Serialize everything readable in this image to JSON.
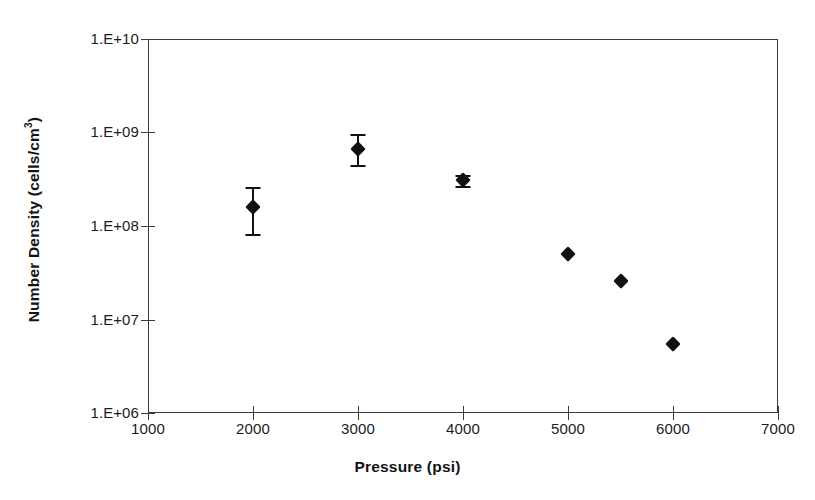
{
  "chart_data": {
    "type": "scatter",
    "title": "",
    "xlabel": "Pressure (psi)",
    "ylabel": "Number Density (cells/cm3)",
    "ylabel_base": "Number Density (cells/cm",
    "ylabel_sup": "3",
    "ylabel_tail": ")",
    "xlim": [
      1000,
      7000
    ],
    "ylim": [
      1000000,
      10000000000
    ],
    "yscale": "log",
    "xscale": "linear",
    "grid": false,
    "legend": null,
    "xticks": [
      1000,
      2000,
      3000,
      4000,
      5000,
      6000,
      7000
    ],
    "xticklabels": [
      "1000",
      "2000",
      "3000",
      "4000",
      "5000",
      "6000",
      "7000"
    ],
    "yticks": [
      1000000,
      10000000,
      100000000,
      1000000000,
      10000000000
    ],
    "yticklabels": [
      "1.E+06",
      "1.E+07",
      "1.E+08",
      "1.E+09",
      "1.E+10"
    ],
    "marker": "filled-diamond",
    "marker_color": "#111111",
    "series": [
      {
        "name": "Number Density",
        "x": [
          2000,
          3000,
          4000,
          5000,
          5500,
          6000
        ],
        "y": [
          160000000.0,
          660000000.0,
          310000000.0,
          50000000.0,
          26000000.0,
          5500000.0
        ],
        "yerr_low": [
          83000000.0,
          450000000.0,
          270000000.0,
          null,
          null,
          null
        ],
        "yerr_high": [
          260000000.0,
          960000000.0,
          350000000.0,
          null,
          null,
          null
        ]
      }
    ],
    "points": [
      {
        "label": "p-2000",
        "x": 2000,
        "y": 160000000.0,
        "err_low": 83000000.0,
        "err_high": 260000000.0,
        "has_errorbar": true
      },
      {
        "label": "p-3000",
        "x": 3000,
        "y": 660000000.0,
        "err_low": 450000000.0,
        "err_high": 960000000.0,
        "has_errorbar": true
      },
      {
        "label": "p-4000",
        "x": 4000,
        "y": 310000000.0,
        "err_low": 270000000.0,
        "err_high": 350000000.0,
        "has_errorbar": true
      },
      {
        "label": "p-5000",
        "x": 5000,
        "y": 50000000.0,
        "err_low": null,
        "err_high": null,
        "has_errorbar": false
      },
      {
        "label": "p-5500",
        "x": 5500,
        "y": 26000000.0,
        "err_low": null,
        "err_high": null,
        "has_errorbar": false
      },
      {
        "label": "p-6000",
        "x": 6000,
        "y": 5500000.0,
        "err_low": null,
        "err_high": null,
        "has_errorbar": false
      }
    ]
  },
  "axis": {
    "y_tick_labels": [
      "1.E+10",
      "1.E+09",
      "1.E+08",
      "1.E+07",
      "1.E+06"
    ],
    "x_tick_labels": [
      "1000",
      "2000",
      "3000",
      "4000",
      "5000",
      "6000",
      "7000"
    ],
    "x_title": "Pressure (psi)"
  },
  "colors": {
    "marker": "#111111",
    "axis": "#3a3a3a",
    "text": "#1a1a1a",
    "background": "#ffffff"
  }
}
